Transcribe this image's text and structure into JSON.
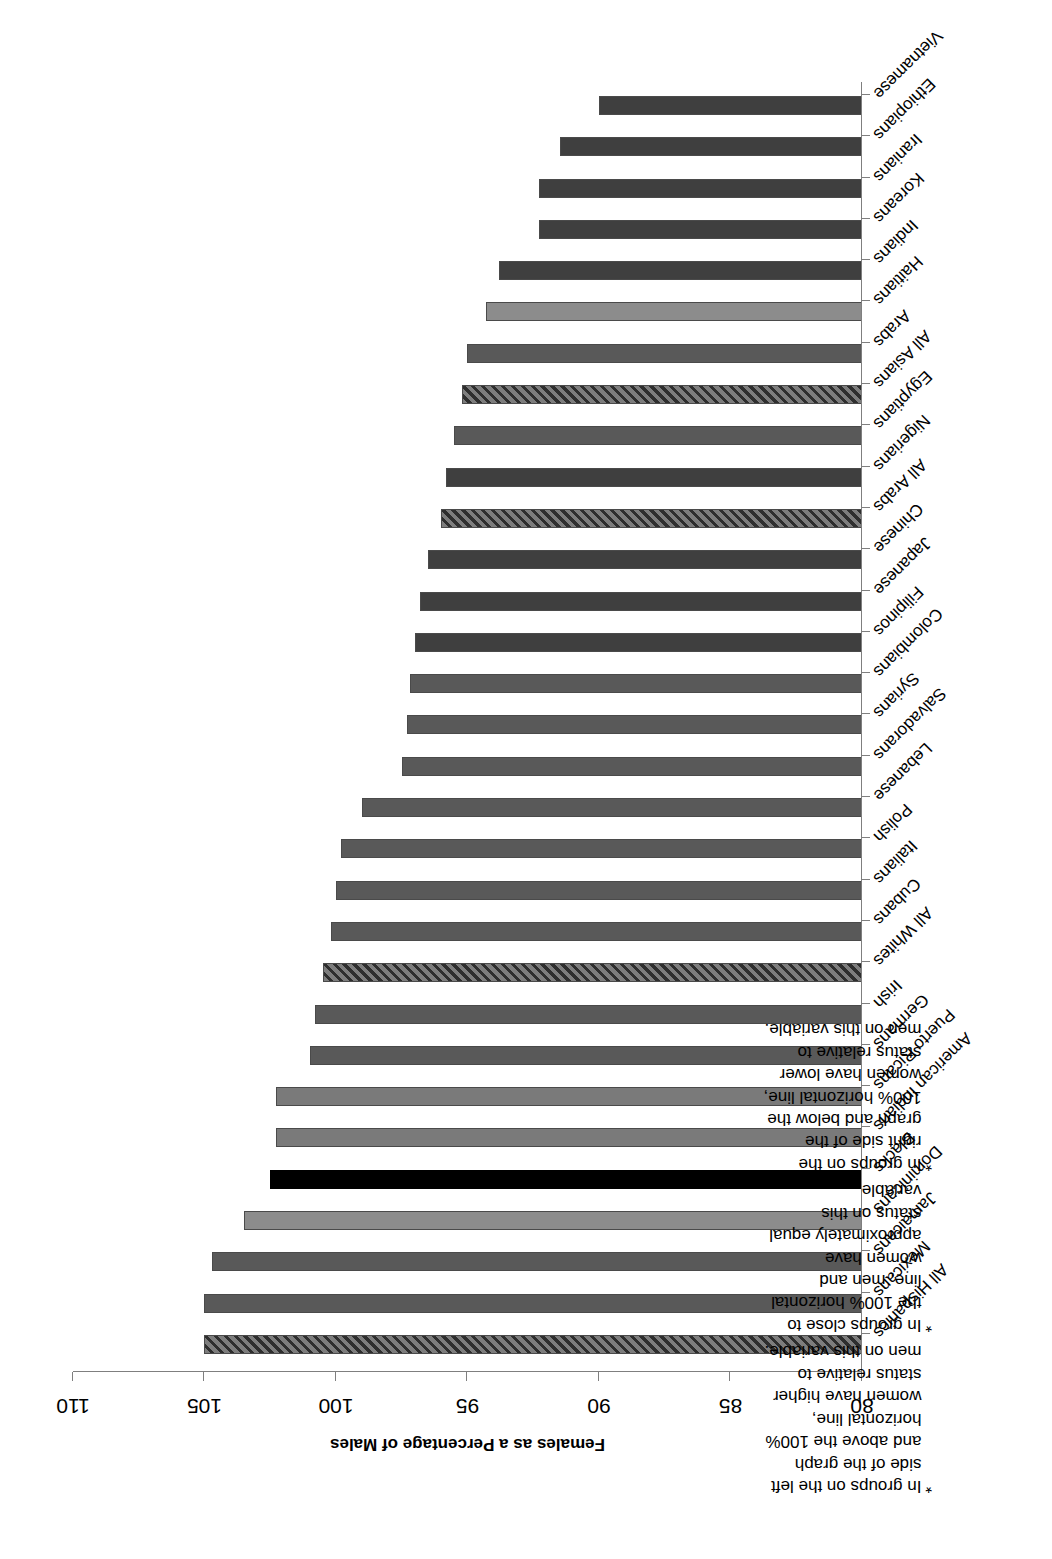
{
  "chart_data": {
    "type": "bar",
    "orientation": "horizontal",
    "title": "",
    "xlabel": "",
    "ylabel": "Females as a Percentage of Males",
    "value_axis_title": "Females as a Percentage of Males",
    "ylim": [
      80,
      110
    ],
    "axis_ticks": [
      110,
      105,
      100,
      95,
      90,
      85,
      80
    ],
    "axis_min": 80,
    "axis_max": 110,
    "grid": false,
    "legend": "none",
    "reference_line": 100,
    "categories": [
      "All Hispanics",
      "Mexicans",
      "Jamaicans",
      "Dominicans",
      "Blacks",
      "American Indians",
      "Puerto Ricans",
      "Germans",
      "Irish",
      "All Whites",
      "Cubans",
      "Italians",
      "Polish",
      "Lebanese",
      "Salvadorans",
      "Syrians",
      "Colombians",
      "Filipinos",
      "Japanese",
      "Chinese",
      "All Arabs",
      "Nigerians",
      "Egyptians",
      "All Asians",
      "Arabs",
      "Haitians",
      "Indians",
      "Koreans",
      "Iranians",
      "Ethiopians",
      "Vietnamese"
    ],
    "values": [
      105.0,
      105.0,
      104.7,
      103.5,
      102.5,
      102.3,
      102.3,
      101.0,
      100.8,
      100.5,
      100.2,
      100.0,
      99.8,
      99.0,
      97.5,
      97.3,
      97.2,
      97.0,
      96.8,
      96.5,
      96.0,
      95.8,
      95.5,
      95.2,
      95.0,
      94.3,
      93.8,
      92.3,
      92.3,
      91.5,
      90.0
    ],
    "styles": [
      "hatch",
      "mid",
      "mid",
      "light",
      "black",
      "light2",
      "light2",
      "mid",
      "mid",
      "hatch",
      "mid",
      "mid",
      "mid",
      "mid",
      "mid",
      "mid",
      "mid",
      "dark",
      "dark",
      "dark",
      "hatch",
      "dark",
      "mid",
      "hatch",
      "mid",
      "light",
      "dark",
      "dark",
      "dark",
      "dark",
      "dark"
    ]
  },
  "notes": [
    {
      "marker": "*",
      "text": "In groups on the left side of the graph and above the 100% horizontal line, women have higher status relative to men on this variable."
    },
    {
      "marker": "*",
      "text": "In groups close to the 100% horizontal line, men and women have approximately equal status on this variable."
    },
    {
      "marker": "*",
      "text": "In groups on the right side of the graph and below the 100% horizontal line, women have lower status relative to men on this variable."
    }
  ],
  "colors": {
    "axis": "#7f7f7f",
    "bar_border": "#4a4a4a",
    "text": "#000000"
  }
}
